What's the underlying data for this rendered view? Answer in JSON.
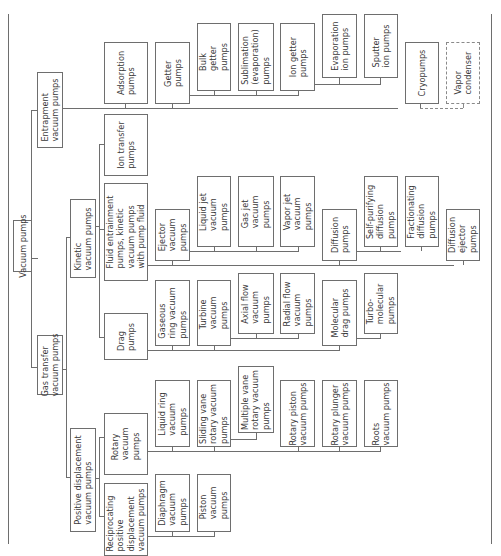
{
  "diagram": {
    "orientation": "rotated 90° counter-clockwise (root at left, leaves toward right)",
    "nodes": {
      "root": "Vacuum pumps",
      "entrapment": "Entrapment\nvacuum pumps",
      "gas_transfer": "Gas transfer\nvacuum pumps",
      "kinetic": "Kinetic\nvacuum pumps",
      "positive_displacement": "Positive displacement\nvacuum pumps",
      "adsorption": "Adsorption\npumps",
      "getter": "Getter\npumps",
      "bulk_getter": "Bulk\ngetter\npumps",
      "sublimation": "Sublimation\n(evaporation)\npumps",
      "ion_getter": "Ion getter\npumps",
      "evaporation_ion": "Evaporation\nion pumps",
      "sputter_ion": "Sputter\nion pumps",
      "cryopumps": "Cryopumps",
      "vapor_condenser": "Vapor\ncondenser",
      "ion_transfer": "Ion transfer\npumps",
      "fluid_entrainment": "Fluid entrainment\npumps, kinetic\nvacuum pumps\nwith pump fluid",
      "ejector": "Ejector\nvacuum\npumps",
      "liquid_jet": "Liquid jet\nvacuum\npumps",
      "gas_jet": "Gas jet\nvacuum\npumps",
      "vapor_jet": "Vapor jet\nvacuum\npumps",
      "diffusion": "Diffusion\npumps",
      "self_purifying": "Self-purifying\ndiffusion\npumps",
      "fractionating": "Fractionating\ndiffusion\npumps",
      "diffusion_ejector": "Diffusion\nejector\npumps",
      "drag": "Drag\npumps",
      "gaseous_ring": "Gaseous\nring vacuum\npumps",
      "turbine": "Turbine\nvacuum\npumps",
      "axial_flow": "Axial flow\nvacuum\npumps",
      "radial_flow": "Radial flow\nvacuum\npumps",
      "molecular_drag": "Molecular\ndrag pumps",
      "turbomolecular": "Turbo-\nmolecular\npumps",
      "rotary": "Rotary\nvacuum\npumps",
      "liquid_ring": "Liquid ring\nvacuum\npumps",
      "sliding_vane": "Sliding vane\nrotary vacuum\npumps",
      "multiple_vane": "Multiple vane\nrotary vacuum\npumps",
      "rotary_piston": "Rotary piston\nvacuum pumps",
      "rotary_plunger": "Rotary plunger\nvacuum pumps",
      "roots": "Roots\nvacuum pumps",
      "reciprocating": "Reciprocating\npositive\ndisplacement\nvacuum pumps",
      "diaphragm": "Diaphragm\nvacuum\npumps",
      "piston": "Piston\nvacuum\npumps"
    },
    "colors": {
      "line": "#6e6e6e",
      "text": "#3a3a3a",
      "background": "#ffffff"
    }
  }
}
